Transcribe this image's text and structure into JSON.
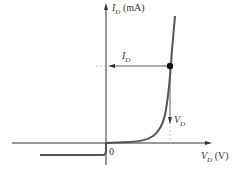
{
  "diagram": {
    "y_axis": {
      "symbol": "I",
      "subscript": "D",
      "unit": "(mA)"
    },
    "x_axis": {
      "symbol": "V",
      "subscript": "D",
      "unit": "(V)"
    },
    "origin_label": "0",
    "current_annotation": {
      "symbol": "I",
      "subscript": "D"
    },
    "voltage_annotation": {
      "symbol": "V",
      "subscript": "D"
    },
    "colors": {
      "curve": "#555555",
      "axes": "#333333",
      "dashed": "#bbbbbb",
      "point": "#111111"
    }
  }
}
